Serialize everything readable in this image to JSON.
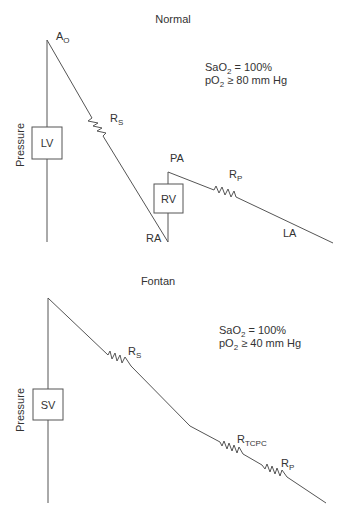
{
  "normal": {
    "title": "Normal",
    "y_axis_label": "Pressure",
    "chambers": {
      "lv": "LV",
      "rv": "RV"
    },
    "nodes": {
      "aorta_main": "A",
      "aorta_sub": "O",
      "ra": "RA",
      "pa": "PA",
      "la": "LA"
    },
    "resistors": {
      "rs_main": "R",
      "rs_sub": "S",
      "rp_main": "R",
      "rp_sub": "P"
    },
    "stats": {
      "sao2_prefix": "SaO",
      "sao2_sub": "2",
      "sao2_value": " = 100%",
      "po2_prefix": "pO",
      "po2_sub": "2",
      "po2_value": " ≥ 80 mm Hg"
    }
  },
  "fontan": {
    "title": "Fontan",
    "y_axis_label": "Pressure",
    "chambers": {
      "sv": "SV"
    },
    "resistors": {
      "rs_main": "R",
      "rs_sub": "S",
      "rtcpc_main": "R",
      "rtcpc_sub": "TCPC",
      "rp_main": "R",
      "rp_sub": "P"
    },
    "stats": {
      "sao2_prefix": "SaO",
      "sao2_sub": "2",
      "sao2_value": " = 100%",
      "po2_prefix": "pO",
      "po2_sub": "2",
      "po2_value": " ≥ 40 mm Hg"
    }
  },
  "colors": {
    "line": "#555555",
    "text": "#333333",
    "background": "#ffffff"
  }
}
